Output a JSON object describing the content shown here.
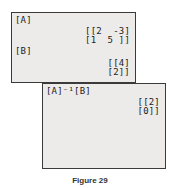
{
  "screen1": {
    "label_a": "[A]",
    "matrix_a_row1": "[[2  -3]",
    "matrix_a_row2": "[1  5 ]]",
    "label_b": "[B]",
    "matrix_b_row1": "[[4]",
    "matrix_b_row2": "[2]]"
  },
  "screen2": {
    "expression": "[A]⁻¹[B]",
    "result_row1": "[[2]",
    "result_row2": "[0]]"
  },
  "caption": "Figure 29"
}
